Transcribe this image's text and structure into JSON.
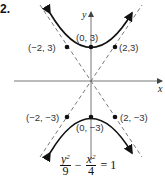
{
  "problem_number": "2.",
  "axes": {
    "x_label": "x",
    "y_label": "y"
  },
  "points": [
    {
      "label": "(0, 3)",
      "x": 0,
      "y": 3
    },
    {
      "label": "(0, −3)",
      "x": 0,
      "y": -3
    },
    {
      "label": "(−2, 3)",
      "x": -2,
      "y": 3
    },
    {
      "label": "(2,3)",
      "x": 2,
      "y": 3
    },
    {
      "label": "(−2, −3)",
      "x": -2,
      "y": -3
    },
    {
      "label": "(2, −3)",
      "x": 2,
      "y": -3
    }
  ],
  "equation": {
    "term1_num": "y",
    "term1_exp": "2",
    "term1_den": "9",
    "operator": "−",
    "term2_num": "x",
    "term2_exp": "2",
    "term2_den": "4",
    "rhs": "= 1"
  },
  "colors": {
    "curve": "#111111",
    "axis": "#666666",
    "asymptote": "#555555"
  }
}
